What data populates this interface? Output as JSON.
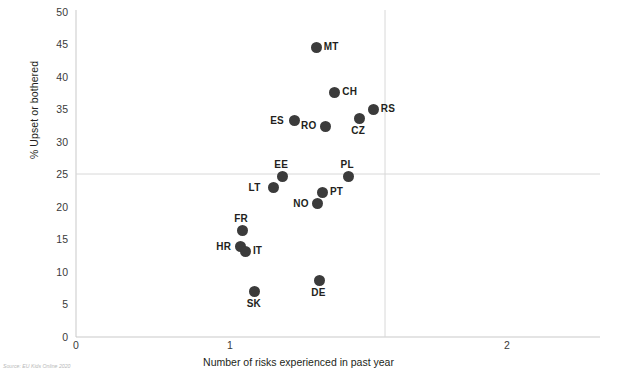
{
  "chart_data": {
    "type": "scatter",
    "title": "",
    "xlabel": "Number of risks experienced in past year",
    "ylabel": "% Upset or bothered",
    "xlim": [
      0,
      2.25
    ],
    "ylim": [
      0,
      50
    ],
    "xticks": [
      0,
      1,
      2
    ],
    "xticklabels": [
      "0",
      "1",
      "2"
    ],
    "yticks": [
      0,
      5,
      10,
      15,
      20,
      25,
      30,
      35,
      40,
      45,
      50
    ],
    "yticklabels": [
      "0",
      "5",
      "10",
      "15",
      "20",
      "25",
      "30",
      "35",
      "40",
      "45",
      "50"
    ],
    "grid": "reference lines at y=25 and x=1.5",
    "reference_lines": {
      "horizontal_y": 25,
      "vertical_x": 1.5
    },
    "legend": "none",
    "marker_color": "#3b3b3b",
    "points": [
      {
        "label": "MT",
        "x": 1.56,
        "y": 44.3,
        "label_pos": "right"
      },
      {
        "label": "CH",
        "x": 1.68,
        "y": 37.4,
        "label_pos": "right"
      },
      {
        "label": "RS",
        "x": 1.93,
        "y": 34.8,
        "label_pos": "right"
      },
      {
        "label": "CZ",
        "x": 1.84,
        "y": 33.4,
        "label_pos": "below"
      },
      {
        "label": "RO",
        "x": 1.62,
        "y": 32.2,
        "label_pos": "left"
      },
      {
        "label": "ES",
        "x": 1.42,
        "y": 33.1,
        "label_pos": "left"
      },
      {
        "label": "EE",
        "x": 1.34,
        "y": 24.6,
        "label_pos": "above"
      },
      {
        "label": "PL",
        "x": 1.77,
        "y": 24.6,
        "label_pos": "above"
      },
      {
        "label": "LT",
        "x": 1.28,
        "y": 22.8,
        "label_pos": "left"
      },
      {
        "label": "PT",
        "x": 1.6,
        "y": 22.1,
        "label_pos": "right"
      },
      {
        "label": "NO",
        "x": 1.57,
        "y": 20.4,
        "label_pos": "left"
      },
      {
        "label": "FR",
        "x": 1.08,
        "y": 16.3,
        "label_pos": "above"
      },
      {
        "label": "HR",
        "x": 1.07,
        "y": 13.8,
        "label_pos": "left"
      },
      {
        "label": "IT",
        "x": 1.1,
        "y": 13.1,
        "label_pos": "right"
      },
      {
        "label": "DE",
        "x": 1.58,
        "y": 8.6,
        "label_pos": "below"
      },
      {
        "label": "SK",
        "x": 1.16,
        "y": 7.0,
        "label_pos": "below"
      }
    ]
  },
  "source": {
    "text": "Source: EU Kids Online 2020"
  }
}
